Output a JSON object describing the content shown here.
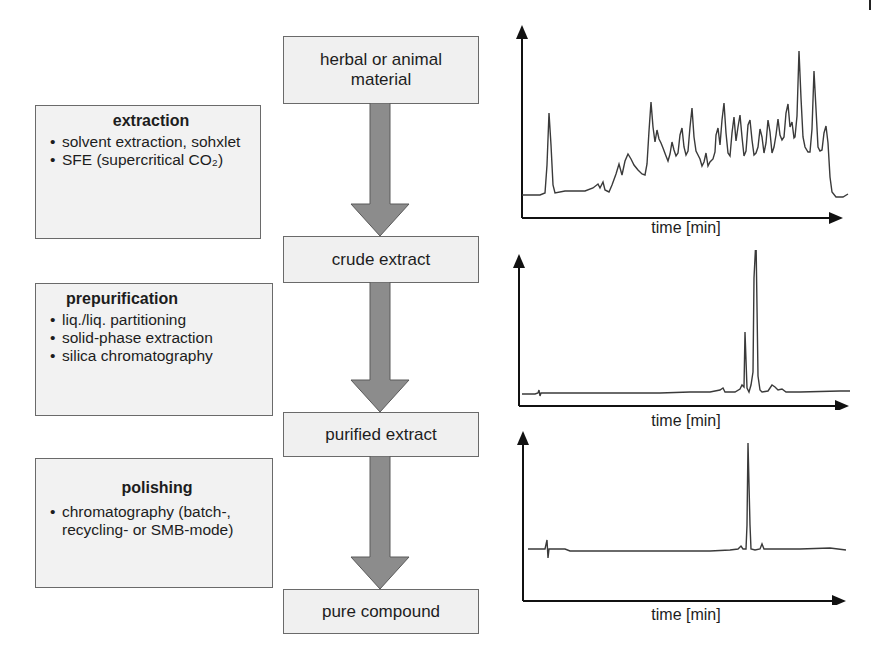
{
  "flow": {
    "stages": [
      {
        "label": "herbal or animal material"
      },
      {
        "label": "crude extract"
      },
      {
        "label": "purified extract"
      },
      {
        "label": "pure compound"
      }
    ],
    "arrow_color": "#8c8c8c"
  },
  "steps": [
    {
      "title": "extraction",
      "items": [
        "solvent extraction, sohxlet",
        "SFE (supercritical CO₂)"
      ]
    },
    {
      "title": "prepurification",
      "items": [
        "liq./liq. partitioning",
        "solid-phase extraction",
        "silica chromatography"
      ]
    },
    {
      "title": "polishing",
      "items": [
        "chromatography (batch-, recycling- or SMB-mode)"
      ]
    }
  ],
  "chromatograms": [
    {
      "stage": "crude extract",
      "xlabel": "time [min]",
      "description": "many overlapping peaks"
    },
    {
      "stage": "purified extract",
      "xlabel": "time [min]",
      "description": "two dominant peaks"
    },
    {
      "stage": "pure compound",
      "xlabel": "time [min]",
      "description": "single sharp peak"
    }
  ]
}
